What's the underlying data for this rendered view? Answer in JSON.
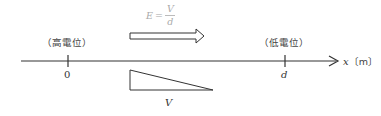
{
  "formula": {
    "lhs": "E",
    "equals": "=",
    "numerator": "V",
    "denominator": "d"
  },
  "labels": {
    "high_potential": "（高電位）",
    "low_potential": "（低電位）",
    "origin_tick": "0",
    "d_tick": "d",
    "axis_var": "x",
    "axis_unit": "〔m〕",
    "potential_label": "V"
  },
  "colors": {
    "line": "#333333",
    "formula": "#aaaaaa"
  }
}
